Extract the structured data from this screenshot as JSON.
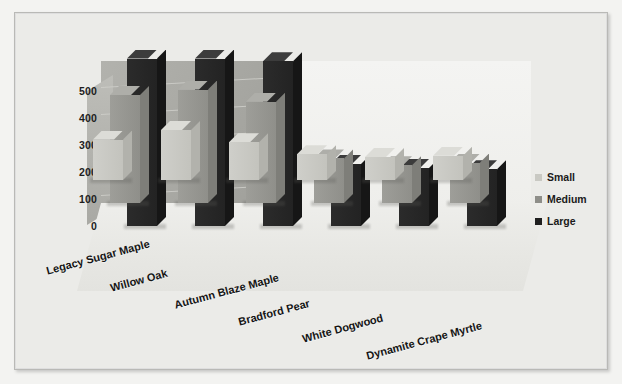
{
  "chart_data": {
    "type": "bar",
    "title": "",
    "subtitle": "",
    "xlabel": "",
    "ylabel": "",
    "ylim": [
      0,
      500
    ],
    "yticks": [
      "0",
      "100",
      "200",
      "300",
      "400",
      "500"
    ],
    "grid": true,
    "legend_position": "right",
    "three_d": true,
    "categories": [
      "Legacy Sugar Maple",
      "Willow Oak",
      "Autumn Blaze Maple",
      "Bradford Pear",
      "White Dogwood",
      "Dynamite Crape Myrtle"
    ],
    "series": [
      {
        "name": "Small",
        "color": "#c9c9c3",
        "values": [
          150,
          185,
          140,
          95,
          85,
          90
        ]
      },
      {
        "name": "Medium",
        "color": "#8e8e89",
        "values": [
          400,
          420,
          375,
          165,
          140,
          150
        ]
      },
      {
        "name": "Large",
        "color": "#1f1f1f",
        "values": [
          620,
          620,
          610,
          230,
          215,
          210
        ]
      }
    ]
  },
  "legend": {
    "items": [
      {
        "label": "Small",
        "swatch": "#c9c9c3"
      },
      {
        "label": "Medium",
        "swatch": "#8e8e89"
      },
      {
        "label": "Large",
        "swatch": "#1f1f1f"
      }
    ]
  },
  "axis": {
    "y_ticks": [
      "500",
      "400",
      "300",
      "200",
      "100",
      "0"
    ]
  },
  "colors": {
    "page_background": "#f3f3f1",
    "plot_background": "#ebebe8",
    "frame_border": "#b9b9b6",
    "back_wall_left": "#a7a7a2",
    "back_wall_right": "#f1f1ee",
    "floor": "#e7e7e3",
    "gridline": "#cfcfca",
    "text": "#151515"
  }
}
